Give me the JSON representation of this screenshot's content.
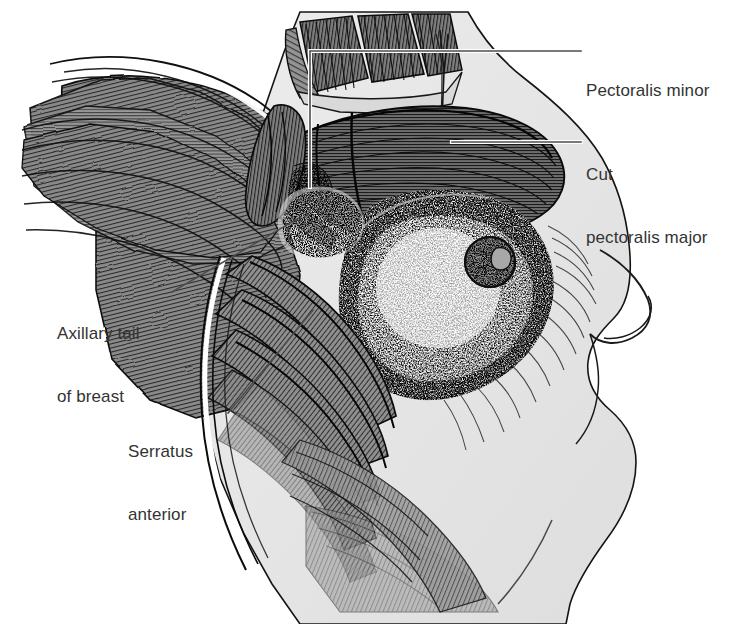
{
  "figure": {
    "domain": "Diagram",
    "width": 740,
    "height": 624,
    "background_color": "#ffffff",
    "ink_color": "#1a1a1a",
    "skin_tone": "#e7e7e7",
    "muscle_tone": "#8d8d8d",
    "label_color": "#333333",
    "leader_color": "#4d4d4d"
  },
  "labels": [
    {
      "id": "pectoralis-minor",
      "lines": [
        "Pectoralis minor"
      ],
      "line1": "Pectoralis minor",
      "line2": "",
      "side": "right",
      "x": 586,
      "y": 38
    },
    {
      "id": "cut-pectoralis-major",
      "lines": [
        "Cut",
        "pectoralis major"
      ],
      "line1": "Cut",
      "line2": "pectoralis major",
      "side": "right",
      "x": 586,
      "y": 122
    },
    {
      "id": "axillary-tail-of-breast",
      "lines": [
        "Axillary tail",
        "of breast"
      ],
      "line1": "Axillary tail",
      "line2": "of breast",
      "side": "left",
      "x": 57,
      "y": 281
    },
    {
      "id": "serratus-anterior",
      "lines": [
        "Serratus",
        "anterior"
      ],
      "line1": "Serratus",
      "line2": "anterior",
      "side": "left",
      "x": 128,
      "y": 399
    }
  ],
  "leader_lines": [
    {
      "id": "leader-pectoralis-minor",
      "target_label": "pectoralis-minor",
      "type": "elbow",
      "points": "581,51 310,51 310,187"
    },
    {
      "id": "leader-cut-pectoralis-major",
      "target_label": "cut-pectoralis-major",
      "type": "straight",
      "points": "581,142 452,142"
    },
    {
      "id": "leader-axillary-tail",
      "target_label": "axillary-tail-of-breast",
      "type": "straight",
      "points": "172,292 297,219"
    },
    {
      "id": "leader-serratus-anterior",
      "target_label": "serratus-anterior",
      "type": "straight",
      "points": "228,413 313,310"
    }
  ],
  "caption": {
    "text": ""
  },
  "structures": [
    {
      "name": "pectoralis-minor",
      "note": "dark ribbed muscle slips at superior chest"
    },
    {
      "name": "cut-pectoralis-major",
      "note": "reflected muscle flap with transverse striations"
    },
    {
      "name": "breast-tissue",
      "note": "stippled glandular parenchyma with nipple and areola"
    },
    {
      "name": "nipple-areola",
      "note": "nipple at approximately x 490 y 262"
    },
    {
      "name": "serratus-anterior",
      "note": "interdigitating slips along lateral chest wall"
    },
    {
      "name": "axillary-tail-of-breast",
      "note": "tail of Spence extending toward axilla"
    },
    {
      "name": "deltoid-and-upper-arm",
      "note": "striated muscle mass upper left"
    },
    {
      "name": "contralateral-breast-profile",
      "note": "body contour on right with breast in profile"
    }
  ]
}
